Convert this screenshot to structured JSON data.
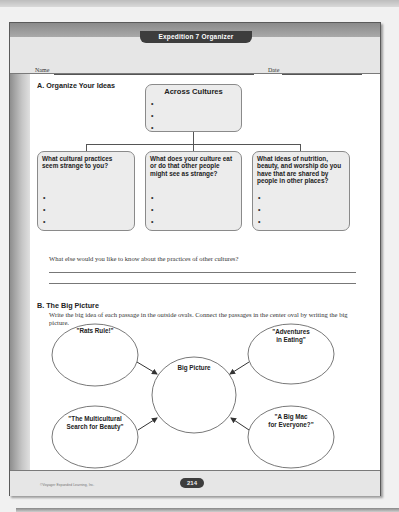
{
  "header": {
    "title": "Expedition 7 Organizer",
    "name_label": "Name",
    "date_label": "Date"
  },
  "section_a": {
    "title": "A.  Organize Your Ideas",
    "top_box": {
      "label": "Across Cultures",
      "bullets": [
        "•",
        "•",
        "•"
      ]
    },
    "boxes": [
      {
        "label": "What cultural practices seem strange to you?",
        "bullets": [
          "•",
          "•",
          "•"
        ]
      },
      {
        "label": "What does your culture eat or do that other people might see as strange?",
        "bullets": [
          "•",
          "•",
          "•"
        ]
      },
      {
        "label": "What ideas of nutrition, beauty, and worship do you have that are shared by people in other places?",
        "bullets": [
          "•",
          "•",
          "•"
        ]
      }
    ],
    "question": "What else would you like to know about the practices of other cultures?"
  },
  "section_b": {
    "title": "B.  The Big Picture",
    "instructions": "Write the big idea of each passage in the outside ovals. Connect the passages in the center oval by writing the big picture.",
    "center_label": "Big Picture",
    "ovals": [
      {
        "line1": "\"Rats Rule!\"",
        "line2": ""
      },
      {
        "line1": "\"Adventures",
        "line2": "in Eating\""
      },
      {
        "line1": "\"The Multicultural",
        "line2": "Search for Beauty\""
      },
      {
        "line1": "\"A Big Mac",
        "line2": "for Everyone?\""
      }
    ]
  },
  "footer": {
    "copyright": "©Voyager Expanded Learning, Inc.",
    "page_number": "214"
  },
  "colors": {
    "pill_bg": "#3d3d3d",
    "box_bg": "#ececec",
    "band_light": "#e6e6e6",
    "band_dark": "#9a9a9a"
  }
}
